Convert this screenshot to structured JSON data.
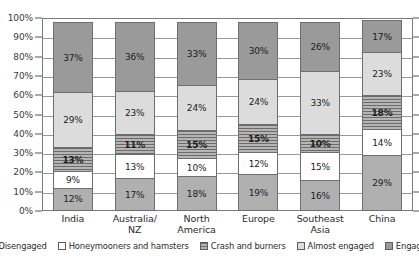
{
  "chart_data": {
    "type": "bar",
    "subtype": "100%-stacked-column",
    "title": "",
    "xlabel": "",
    "ylabel": "",
    "ylim": [
      0,
      100
    ],
    "ytick_labels": [
      "100%",
      "90%",
      "80%",
      "70%",
      "60%",
      "50%",
      "40%",
      "30%",
      "20%",
      "10%",
      "0%"
    ],
    "ytick_values": [
      100,
      90,
      80,
      70,
      60,
      50,
      40,
      30,
      20,
      10,
      0
    ],
    "grid": true,
    "legend_position": "bottom",
    "categories": [
      "India",
      "Australia/ NZ",
      "North America",
      "Europe",
      "Southeast Asia",
      "China"
    ],
    "category_lines": [
      [
        "India",
        ""
      ],
      [
        "Australia/",
        "NZ"
      ],
      [
        "North",
        "America"
      ],
      [
        "Europe",
        ""
      ],
      [
        "Southeast Asia",
        ""
      ],
      [
        "China",
        ""
      ]
    ],
    "series": [
      {
        "name": "Disengaged",
        "fill": "fill-disengaged",
        "color": "#b0b0b0",
        "values": [
          12,
          17,
          18,
          19,
          16,
          29
        ],
        "labels": [
          "12%",
          "17%",
          "18%",
          "19%",
          "16%",
          "29%"
        ]
      },
      {
        "name": "Honeymooners and hamsters",
        "fill": "fill-honeymooners",
        "color": "#ffffff",
        "values": [
          9,
          13,
          10,
          12,
          15,
          14
        ],
        "labels": [
          "9%",
          "13%",
          "10%",
          "12%",
          "15%",
          "14%"
        ]
      },
      {
        "name": "Crash and burners",
        "fill": "fill-crash",
        "color": "#8e8e8e",
        "values": [
          13,
          11,
          15,
          15,
          10,
          18
        ],
        "labels": [
          "13%",
          "11%",
          "15%",
          "15%",
          "10%",
          "18%"
        ]
      },
      {
        "name": "Almost engaged",
        "fill": "fill-almost",
        "color": "#dcdcdc",
        "values": [
          29,
          23,
          24,
          24,
          33,
          23
        ],
        "labels": [
          "29%",
          "23%",
          "24%",
          "24%",
          "33%",
          "23%"
        ]
      },
      {
        "name": "Engaged",
        "fill": "fill-engaged",
        "color": "#9a9a9a",
        "values": [
          37,
          36,
          33,
          30,
          26,
          17
        ],
        "labels": [
          "37%",
          "36%",
          "33%",
          "30%",
          "26%",
          "17%"
        ]
      }
    ]
  }
}
